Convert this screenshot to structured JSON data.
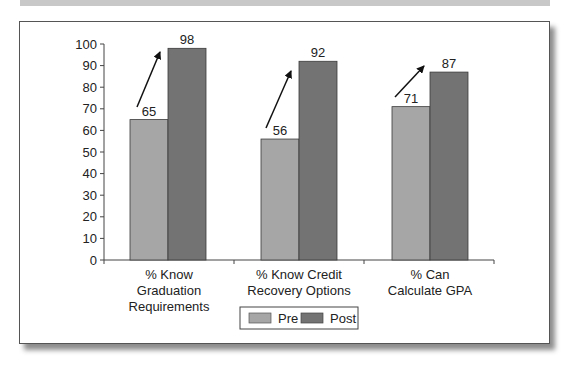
{
  "chart_data": {
    "type": "bar",
    "title": "",
    "xlabel": "",
    "ylabel": "",
    "ylim": [
      0,
      100
    ],
    "yticks": [
      0,
      10,
      20,
      30,
      40,
      50,
      60,
      70,
      80,
      90,
      100
    ],
    "categories": [
      [
        "% Know",
        "Graduation",
        "Requirements"
      ],
      [
        "% Know Credit",
        "Recovery Options"
      ],
      [
        "% Can",
        "Calculate GPA"
      ]
    ],
    "category_names": [
      "% Know Graduation Requirements",
      "% Know Credit Recovery Options",
      "% Can Calculate GPA"
    ],
    "series": [
      {
        "name": "Pre",
        "values": [
          65,
          56,
          71
        ],
        "color": "#a6a6a6"
      },
      {
        "name": "Post",
        "values": [
          98,
          92,
          87
        ],
        "color": "#737373"
      }
    ],
    "annotations": [
      "upward arrow from Pre to Post for each category"
    ],
    "legend_position": "bottom",
    "grid": false
  },
  "legend": {
    "items": [
      {
        "label": "Pre",
        "color": "#a6a6a6"
      },
      {
        "label": "Post",
        "color": "#737373"
      }
    ]
  }
}
